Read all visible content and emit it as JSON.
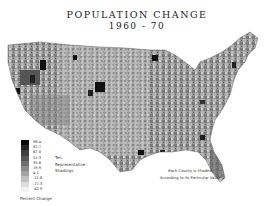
{
  "title": {
    "line1": "POPULATION  CHANGE",
    "line2": "1960 - 70"
  },
  "legend": {
    "values": [
      "98.4",
      "82.7",
      "67.0",
      "51.3",
      "35.6",
      "19.9",
      "4.1",
      "-11.6",
      "-27.3",
      "-42.9"
    ],
    "colors": [
      "#0a0a0a",
      "#262626",
      "#3d3d3d",
      "#555555",
      "#6e6e6e",
      "#8a8a8a",
      "#a3a3a3",
      "#c0c0c0",
      "#dcdcdc",
      "#f2f2f2"
    ],
    "note_lines": [
      "Ten",
      "Representative",
      "Shadings"
    ],
    "caption": "Percent Change"
  },
  "footnote": {
    "line1": "Each County is Shaded",
    "line2": "According to its Particular Value"
  },
  "map": {
    "region": "Conterminous United States",
    "type": "county choropleth, grayscale"
  }
}
